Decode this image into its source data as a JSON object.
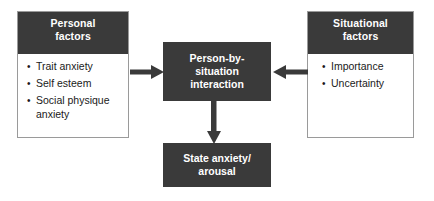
{
  "diagram": {
    "colors": {
      "box_fill": "#3a3a3a",
      "box_text": "#ffffff",
      "panel_border": "#9a9a9a",
      "body_text": "#1a1a1a",
      "background": "#ffffff",
      "arrow": "#3a3a3a"
    },
    "nodes": {
      "personal_factors": {
        "header_line1": "Personal",
        "header_line2": "factors",
        "items": [
          "Trait anxiety",
          "Self esteem",
          "Social physique anxiety"
        ]
      },
      "situational_factors": {
        "header_line1": "Situational",
        "header_line2": "factors",
        "items": [
          "Importance",
          "Uncertainty"
        ]
      },
      "interaction": {
        "line1": "Person-by-",
        "line2": "situation",
        "line3": "interaction"
      },
      "outcome": {
        "line1": "State anxiety/",
        "line2": "arousal"
      }
    },
    "edges": [
      {
        "id": "personal-to-interaction",
        "from": "personal_factors",
        "to": "interaction",
        "direction": "right"
      },
      {
        "id": "situational-to-interaction",
        "from": "situational_factors",
        "to": "interaction",
        "direction": "left"
      },
      {
        "id": "interaction-to-outcome",
        "from": "interaction",
        "to": "outcome",
        "direction": "down"
      }
    ]
  }
}
